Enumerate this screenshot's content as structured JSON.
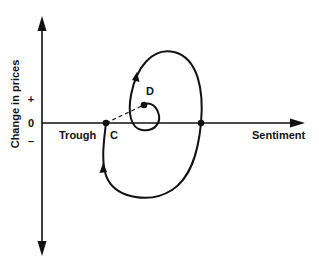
{
  "diagram": {
    "type": "sentiment-price cycle",
    "y_axis": {
      "label": "Change in prices",
      "ticks": {
        "plus": "+",
        "zero": "0",
        "minus": "–"
      }
    },
    "x_axis": {
      "label": "Sentiment"
    },
    "points": {
      "C": {
        "label": "C",
        "annotation": "Trough"
      },
      "D": {
        "label": "D"
      },
      "right_crossing": {
        "label": ""
      }
    },
    "colors": {
      "line": "#111111",
      "background": "#ffffff"
    }
  }
}
